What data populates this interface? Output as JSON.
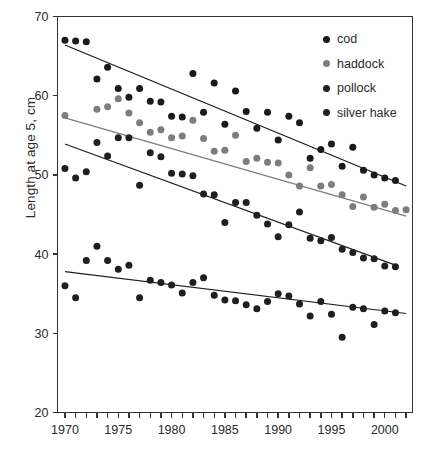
{
  "chart_data": {
    "type": "scatter",
    "title": "",
    "xlabel": "",
    "ylabel": "Length at age 5, cm",
    "xlim": [
      1969.3,
      2002.6
    ],
    "ylim": [
      20,
      70
    ],
    "yticks": [
      20,
      30,
      40,
      50,
      60,
      70
    ],
    "ytick_labels": [
      "20",
      "30",
      "40",
      "50",
      "60",
      "70"
    ],
    "xticks": [
      1970,
      1971,
      1972,
      1973,
      1974,
      1975,
      1976,
      1977,
      1978,
      1979,
      1980,
      1981,
      1982,
      1983,
      1984,
      1985,
      1986,
      1987,
      1988,
      1989,
      1990,
      1991,
      1992,
      1993,
      1994,
      1995,
      1996,
      1997,
      1998,
      1999,
      2000,
      2001,
      2002
    ],
    "xtick_labels": [
      "1970",
      "1975",
      "1980",
      "1985",
      "1990",
      "1995",
      "2000"
    ],
    "xtick_labelled": [
      1970,
      1975,
      1980,
      1985,
      1990,
      1995,
      2000
    ],
    "grid": false,
    "legend_position": "top-right",
    "series": [
      {
        "name": "cod",
        "color": "#1a1a1a",
        "marker": "circle",
        "trendline": {
          "x": [
            1970,
            2002
          ],
          "y": [
            66.4,
            48.6
          ]
        },
        "points": [
          {
            "x": 1970,
            "y": 67.0
          },
          {
            "x": 1971,
            "y": 66.9
          },
          {
            "x": 1972,
            "y": 66.8
          },
          {
            "x": 1973,
            "y": 62.1
          },
          {
            "x": 1974,
            "y": 63.6
          },
          {
            "x": 1975,
            "y": 60.9
          },
          {
            "x": 1976,
            "y": 59.8
          },
          {
            "x": 1977,
            "y": 60.9
          },
          {
            "x": 1978,
            "y": 59.3
          },
          {
            "x": 1979,
            "y": 59.2
          },
          {
            "x": 1980,
            "y": 57.4
          },
          {
            "x": 1981,
            "y": 57.3
          },
          {
            "x": 1982,
            "y": 62.8
          },
          {
            "x": 1983,
            "y": 57.9
          },
          {
            "x": 1984,
            "y": 61.6
          },
          {
            "x": 1985,
            "y": 56.4
          },
          {
            "x": 1986,
            "y": 60.6
          },
          {
            "x": 1987,
            "y": 58.0
          },
          {
            "x": 1988,
            "y": 55.9
          },
          {
            "x": 1989,
            "y": 57.9
          },
          {
            "x": 1990,
            "y": 54.4
          },
          {
            "x": 1991,
            "y": 57.4
          },
          {
            "x": 1992,
            "y": 56.6
          },
          {
            "x": 1993,
            "y": 52.1
          },
          {
            "x": 1994,
            "y": 53.2
          },
          {
            "x": 1995,
            "y": 53.9
          },
          {
            "x": 1996,
            "y": 51.1
          },
          {
            "x": 1997,
            "y": 53.5
          },
          {
            "x": 1998,
            "y": 50.6
          },
          {
            "x": 1999,
            "y": 50.0
          },
          {
            "x": 2000,
            "y": 49.6
          },
          {
            "x": 2001,
            "y": 49.3
          }
        ]
      },
      {
        "name": "haddock",
        "color": "#7d7d7d",
        "marker": "circle",
        "trendline": {
          "x": [
            1970,
            2002
          ],
          "y": [
            57.2,
            44.8
          ]
        },
        "points": [
          {
            "x": 1970,
            "y": 57.5
          },
          {
            "x": 1973,
            "y": 58.3
          },
          {
            "x": 1974,
            "y": 58.6
          },
          {
            "x": 1975,
            "y": 59.6
          },
          {
            "x": 1976,
            "y": 57.8
          },
          {
            "x": 1977,
            "y": 56.6
          },
          {
            "x": 1978,
            "y": 55.4
          },
          {
            "x": 1979,
            "y": 55.7
          },
          {
            "x": 1980,
            "y": 54.7
          },
          {
            "x": 1981,
            "y": 54.9
          },
          {
            "x": 1982,
            "y": 56.9
          },
          {
            "x": 1983,
            "y": 54.6
          },
          {
            "x": 1984,
            "y": 53.0
          },
          {
            "x": 1985,
            "y": 53.1
          },
          {
            "x": 1986,
            "y": 55.0
          },
          {
            "x": 1987,
            "y": 51.7
          },
          {
            "x": 1988,
            "y": 52.1
          },
          {
            "x": 1989,
            "y": 51.6
          },
          {
            "x": 1990,
            "y": 51.5
          },
          {
            "x": 1991,
            "y": 50.0
          },
          {
            "x": 1992,
            "y": 48.6
          },
          {
            "x": 1993,
            "y": 50.9
          },
          {
            "x": 1994,
            "y": 48.6
          },
          {
            "x": 1995,
            "y": 48.8
          },
          {
            "x": 1996,
            "y": 47.5
          },
          {
            "x": 1997,
            "y": 46.0
          },
          {
            "x": 1998,
            "y": 47.2
          },
          {
            "x": 1999,
            "y": 45.9
          },
          {
            "x": 2000,
            "y": 46.3
          },
          {
            "x": 2001,
            "y": 45.5
          },
          {
            "x": 2002,
            "y": 45.6
          }
        ]
      },
      {
        "name": "pollock",
        "color": "#1f1f1f",
        "marker": "circle",
        "trendline": {
          "x": [
            1970,
            2001
          ],
          "y": [
            53.9,
            38.6
          ]
        },
        "points": [
          {
            "x": 1970,
            "y": 50.8
          },
          {
            "x": 1971,
            "y": 49.6
          },
          {
            "x": 1972,
            "y": 50.4
          },
          {
            "x": 1973,
            "y": 54.1
          },
          {
            "x": 1974,
            "y": 52.4
          },
          {
            "x": 1975,
            "y": 54.7
          },
          {
            "x": 1976,
            "y": 54.7
          },
          {
            "x": 1977,
            "y": 48.7
          },
          {
            "x": 1978,
            "y": 52.8
          },
          {
            "x": 1979,
            "y": 52.3
          },
          {
            "x": 1980,
            "y": 50.2
          },
          {
            "x": 1981,
            "y": 50.1
          },
          {
            "x": 1982,
            "y": 49.9
          },
          {
            "x": 1983,
            "y": 47.6
          },
          {
            "x": 1984,
            "y": 47.5
          },
          {
            "x": 1985,
            "y": 44.0
          },
          {
            "x": 1986,
            "y": 46.5
          },
          {
            "x": 1987,
            "y": 46.5
          },
          {
            "x": 1988,
            "y": 44.9
          },
          {
            "x": 1989,
            "y": 43.8
          },
          {
            "x": 1990,
            "y": 42.2
          },
          {
            "x": 1991,
            "y": 43.7
          },
          {
            "x": 1992,
            "y": 45.3
          },
          {
            "x": 1993,
            "y": 42.0
          },
          {
            "x": 1994,
            "y": 41.7
          },
          {
            "x": 1995,
            "y": 42.1
          },
          {
            "x": 1996,
            "y": 40.6
          },
          {
            "x": 1997,
            "y": 40.2
          },
          {
            "x": 1998,
            "y": 39.5
          },
          {
            "x": 1999,
            "y": 39.4
          },
          {
            "x": 2000,
            "y": 38.5
          },
          {
            "x": 2001,
            "y": 38.4
          }
        ]
      },
      {
        "name": "silver hake",
        "color": "#1f1f1f",
        "marker": "circle",
        "trendline": {
          "x": [
            1970,
            2002
          ],
          "y": [
            37.8,
            32.5
          ]
        },
        "points": [
          {
            "x": 1970,
            "y": 36.0
          },
          {
            "x": 1971,
            "y": 34.5
          },
          {
            "x": 1972,
            "y": 39.2
          },
          {
            "x": 1973,
            "y": 41.0
          },
          {
            "x": 1974,
            "y": 39.2
          },
          {
            "x": 1975,
            "y": 38.1
          },
          {
            "x": 1976,
            "y": 38.6
          },
          {
            "x": 1977,
            "y": 34.5
          },
          {
            "x": 1978,
            "y": 36.7
          },
          {
            "x": 1979,
            "y": 36.4
          },
          {
            "x": 1980,
            "y": 36.1
          },
          {
            "x": 1981,
            "y": 35.1
          },
          {
            "x": 1982,
            "y": 36.4
          },
          {
            "x": 1983,
            "y": 37.0
          },
          {
            "x": 1984,
            "y": 34.8
          },
          {
            "x": 1985,
            "y": 34.2
          },
          {
            "x": 1986,
            "y": 34.1
          },
          {
            "x": 1987,
            "y": 33.6
          },
          {
            "x": 1988,
            "y": 33.1
          },
          {
            "x": 1989,
            "y": 34.0
          },
          {
            "x": 1990,
            "y": 35.0
          },
          {
            "x": 1991,
            "y": 34.7
          },
          {
            "x": 1992,
            "y": 33.7
          },
          {
            "x": 1993,
            "y": 32.2
          },
          {
            "x": 1994,
            "y": 34.0
          },
          {
            "x": 1995,
            "y": 32.4
          },
          {
            "x": 1996,
            "y": 29.5
          },
          {
            "x": 1997,
            "y": 33.3
          },
          {
            "x": 1998,
            "y": 33.1
          },
          {
            "x": 1999,
            "y": 31.1
          },
          {
            "x": 2000,
            "y": 32.8
          },
          {
            "x": 2001,
            "y": 32.6
          }
        ]
      }
    ]
  },
  "legend": {
    "items": [
      {
        "label": "cod",
        "color": "#1a1a1a"
      },
      {
        "label": "haddock",
        "color": "#7d7d7d"
      },
      {
        "label": "pollock",
        "color": "#1f1f1f"
      },
      {
        "label": "silver hake",
        "color": "#1f1f1f"
      }
    ]
  },
  "axes": {
    "y_title": "Length at age 5, cm"
  }
}
